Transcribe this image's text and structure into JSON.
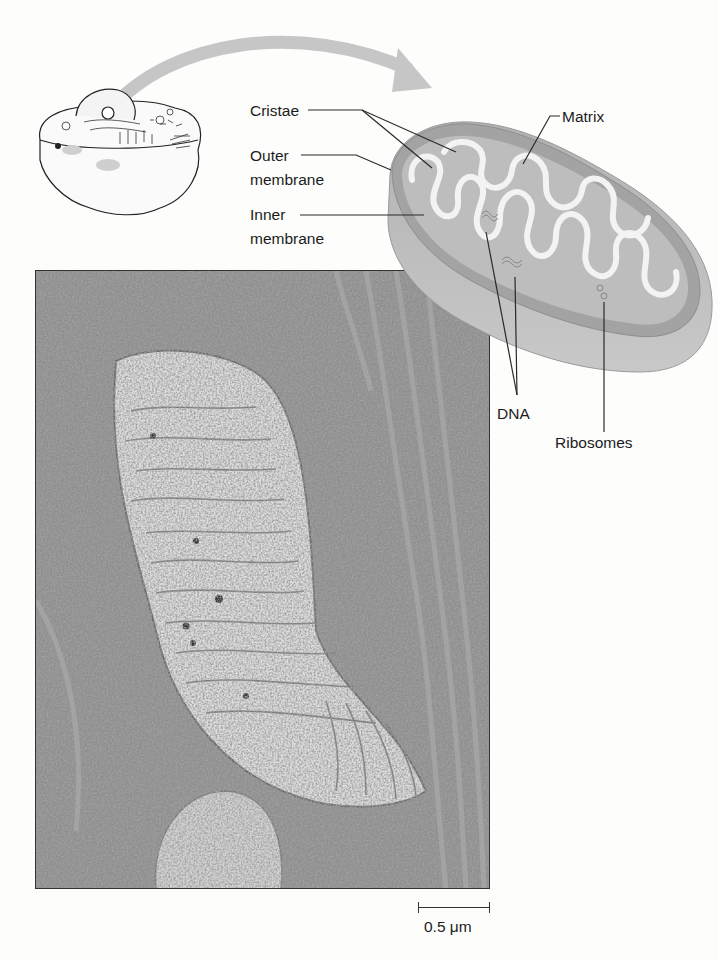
{
  "figure": {
    "type": "mitochondrion structure diagram with electron micrograph",
    "labels": {
      "cristae": "Cristae",
      "outer_membrane_line1": "Outer",
      "outer_membrane_line2": "membrane",
      "inner_membrane_line1": "Inner",
      "inner_membrane_line2": "membrane",
      "matrix": "Matrix",
      "dna": "DNA",
      "ribosomes": "Ribosomes"
    },
    "scale_bar": {
      "label": "0.5 μm"
    },
    "illustrations": {
      "cell": "animal-cell-cutaway",
      "arrow": "curved-arrow-cell-to-mitochondrion",
      "mitochondrion": "mitochondrion-3d-cutaway",
      "micrograph": "tem-micrograph-mitochondrion"
    },
    "colors": {
      "arrow": "#c4c4c4",
      "mito_outer": "#a9a9a9",
      "mito_inner_fill": "#bdbdbd",
      "cristae_membrane": "#f2f2f2",
      "leader_lines": "#2a2a2a",
      "micrograph_dark": "#6e6e6e",
      "micrograph_light": "#d6d6d6"
    }
  }
}
